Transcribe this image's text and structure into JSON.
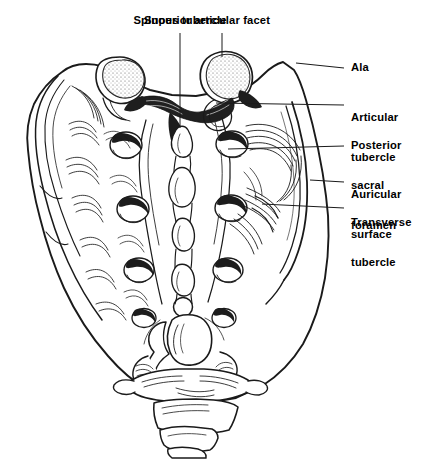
{
  "figure": {
    "width": 423,
    "height": 459,
    "background_color": "#ffffff",
    "ink_color": "#1a1a1a",
    "style": "black-and-white anatomical line engraving"
  },
  "labels": {
    "spinous_tubercle": "Spinous tubercle",
    "superior_articular_facet": "Superior articular facet",
    "ala": "Ala",
    "articular_tubercle_l1": "Articular",
    "articular_tubercle_l2": "tubercle",
    "posterior_sacral_foramen_l1": "Posterior",
    "posterior_sacral_foramen_l2": "sacral",
    "posterior_sacral_foramen_l3": "foramen",
    "auricular_surface_l1": "Auricular",
    "auricular_surface_l2": "surface",
    "transverse_tubercle_l1": "Transverse",
    "transverse_tubercle_l2": "tubercle"
  },
  "callouts": [
    {
      "name": "spinous-tubercle",
      "text": "Spinous tubercle",
      "side": "top",
      "leader_from": [
        180,
        33
      ],
      "leader_to": [
        180,
        128
      ]
    },
    {
      "name": "superior-articular-facet",
      "text": "Superior articular facet",
      "side": "top",
      "leader_from": [
        222,
        33
      ],
      "leader_to": [
        222,
        57
      ]
    },
    {
      "name": "ala",
      "text": "Ala",
      "side": "right",
      "leader_from": [
        344,
        68
      ],
      "leader_to": [
        296,
        63
      ]
    },
    {
      "name": "articular-tubercle",
      "text": "Articular tubercle",
      "side": "right",
      "leader_from": [
        344,
        105
      ],
      "leader_to": [
        216,
        103
      ]
    },
    {
      "name": "posterior-sacral-foramen",
      "text": "Posterior sacral foramen",
      "side": "right",
      "leader_from": [
        344,
        146
      ],
      "leader_to": [
        228,
        149
      ]
    },
    {
      "name": "auricular-surface",
      "text": "Auricular surface",
      "side": "right",
      "leader_from": [
        344,
        182
      ],
      "leader_to": [
        310,
        180
      ]
    },
    {
      "name": "transverse-tubercle",
      "text": "Transverse tubercle",
      "side": "right",
      "leader_from": [
        344,
        208
      ],
      "leader_to": [
        262,
        204
      ]
    }
  ],
  "anatomy": {
    "foramen_pairs": 4,
    "coccyx_segments": 4,
    "median_crest_tubercles": 4
  }
}
